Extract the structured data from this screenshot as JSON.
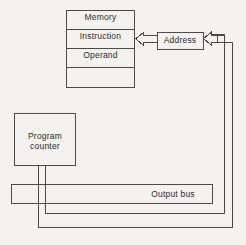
{
  "diagram": {
    "background_color": "#f3f2ef",
    "line_color": "#4a4a4a",
    "box_fill": "#f3f2ef",
    "text_color": "#2b2b2b",
    "blocks": {
      "memory": {
        "label": "Memory",
        "rows": [
          {
            "name": "memory-row",
            "label": "Memory"
          },
          {
            "name": "instruction-row",
            "label": "Instruction"
          },
          {
            "name": "operand-row",
            "label": "Operand"
          },
          {
            "name": "empty-row",
            "label": ""
          }
        ]
      },
      "address": {
        "label": "Address"
      },
      "program_counter": {
        "label": "Program\ncounter",
        "line1": "Program",
        "line2": "counter"
      },
      "output_bus": {
        "label": "Output bus"
      }
    },
    "connections": [
      {
        "name": "address-to-instruction",
        "style": "hollow-block-arrow",
        "direction": "left"
      },
      {
        "name": "bus-to-address",
        "style": "hollow-block-arrow",
        "direction": "left"
      },
      {
        "name": "program-counter-to-bus-inner",
        "style": "line"
      },
      {
        "name": "program-counter-to-bus-outer",
        "style": "line"
      }
    ]
  }
}
